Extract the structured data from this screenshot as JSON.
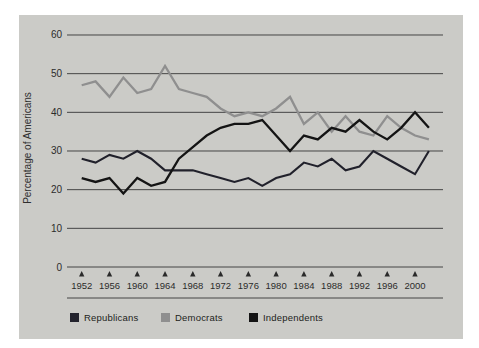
{
  "figure": {
    "y_axis_title": "Percentage of Americans",
    "legend": [
      {
        "label": "Republicans",
        "color": "#23232d"
      },
      {
        "label": "Democrats",
        "color": "#8f8f8f"
      },
      {
        "label": "Independents",
        "color": "#141414"
      }
    ]
  },
  "chart_data": {
    "type": "line",
    "x": [
      1952,
      1954,
      1956,
      1958,
      1960,
      1962,
      1964,
      1966,
      1968,
      1970,
      1972,
      1974,
      1976,
      1978,
      1980,
      1982,
      1984,
      1986,
      1988,
      1990,
      1992,
      1994,
      1996,
      1998,
      2000,
      2002
    ],
    "series": [
      {
        "name": "Democrats",
        "color": "#8f8f8f",
        "width": 2.3,
        "values": [
          47,
          48,
          44,
          49,
          45,
          46,
          52,
          46,
          45,
          44,
          41,
          39,
          40,
          39,
          41,
          44,
          37,
          40,
          35,
          39,
          35,
          34,
          39,
          36,
          34,
          33
        ]
      },
      {
        "name": "Republicans",
        "color": "#21212b",
        "width": 2.1,
        "values": [
          28,
          27,
          29,
          28,
          30,
          28,
          25,
          25,
          25,
          24,
          23,
          22,
          23,
          21,
          23,
          24,
          27,
          26,
          28,
          25,
          26,
          30,
          28,
          26,
          24,
          30
        ]
      },
      {
        "name": "Independents",
        "color": "#141414",
        "width": 2.3,
        "values": [
          23,
          22,
          23,
          19,
          23,
          21,
          22,
          28,
          31,
          34,
          36,
          37,
          37,
          38,
          34,
          30,
          34,
          33,
          36,
          35,
          38,
          35,
          33,
          36,
          40,
          36
        ]
      }
    ],
    "title": "",
    "xlabel": "",
    "ylabel": "Percentage of Americans",
    "ylim": [
      0,
      60
    ],
    "yticks": [
      0,
      10,
      20,
      30,
      40,
      50,
      60
    ],
    "xticks": [
      1952,
      1956,
      1960,
      1964,
      1968,
      1972,
      1976,
      1980,
      1984,
      1988,
      1992,
      1996,
      2000
    ],
    "grid": "horizontal",
    "legend_position": "bottom",
    "tick_marker": "up-triangle"
  },
  "style": {
    "grid_color": "#454545",
    "text_color": "#2b2b2b",
    "page_bg": "#cbcbc7"
  }
}
